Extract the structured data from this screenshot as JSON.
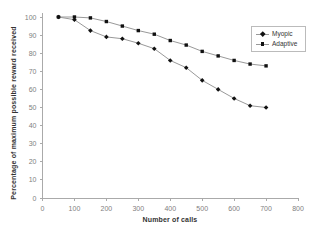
{
  "figure": {
    "background": "#ffffff"
  },
  "chart_data": {
    "type": "line",
    "title": "",
    "xlabel": "Number of calls",
    "ylabel": "Percentage of maximum possible reward received",
    "xlim": [
      0,
      800
    ],
    "ylim": [
      0,
      100
    ],
    "x_ticks": [
      0,
      100,
      200,
      300,
      400,
      500,
      600,
      700,
      800
    ],
    "y_ticks": [
      0,
      10,
      20,
      30,
      40,
      50,
      60,
      70,
      80,
      90,
      100
    ],
    "grid": false,
    "legend": {
      "position": "upper-right",
      "border": true,
      "entries": [
        "Myopic",
        "Adaptive"
      ]
    },
    "x": [
      50,
      100,
      150,
      200,
      250,
      300,
      350,
      400,
      450,
      500,
      550,
      600,
      650,
      700
    ],
    "series": [
      {
        "name": "Myopic",
        "marker": "diamond",
        "values": [
          100,
          98.5,
          92.5,
          89,
          88,
          85.5,
          82.5,
          76,
          72,
          65,
          60,
          55,
          51,
          50
        ]
      },
      {
        "name": "Adaptive",
        "marker": "square",
        "values": [
          100,
          100,
          99.5,
          97.5,
          95,
          92.5,
          90.5,
          87,
          84.5,
          81,
          78.5,
          76,
          74,
          73
        ]
      }
    ],
    "colors": {
      "line": "#999999",
      "marker": "#111111",
      "axis": "#aaaaaa",
      "tick_text": "#808080",
      "label_text": "#333333"
    }
  }
}
